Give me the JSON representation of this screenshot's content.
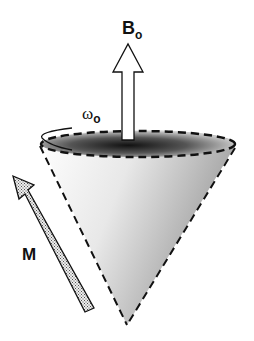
{
  "diagram": {
    "labels": {
      "field": "B",
      "field_sub": "o",
      "frequency": "ω",
      "frequency_sub": "o",
      "magnetization": "M"
    },
    "colors": {
      "outline": "#111111",
      "cone_light": "#ffffff",
      "cone_dark": "#1a1a1a",
      "arrow_fill": "#ffffff",
      "m_arrow_fill": "#d8d8d8"
    }
  }
}
